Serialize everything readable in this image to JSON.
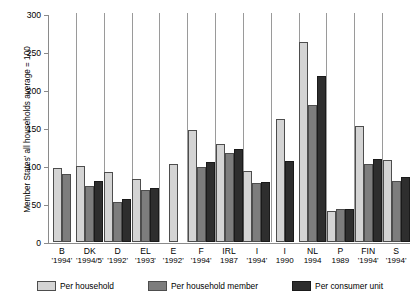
{
  "chart_data": {
    "type": "bar",
    "title": "",
    "subtitle": "",
    "xlabel": "",
    "ylabel": "Member States' all households average = 100",
    "ylim": [
      0,
      300
    ],
    "yticks": [
      0,
      50,
      100,
      150,
      200,
      250,
      300
    ],
    "grid": false,
    "legend_position": "bottom",
    "categories": [
      "B",
      "DK",
      "D",
      "EL",
      "E",
      "F",
      "IRL",
      "I",
      "I",
      "NL",
      "P",
      "FIN",
      "S"
    ],
    "category_years": [
      "'1994'",
      "'1994/5'",
      "'1992'",
      "'1993'",
      "'1992'",
      "'1994'",
      "1987",
      "'1994'",
      "1990",
      "1994",
      "1989",
      "'1994'",
      "'1994'"
    ],
    "series": [
      {
        "name": "Per household",
        "color": "#d4d4d4",
        "values": [
          97,
          100,
          92,
          83,
          103,
          148,
          129,
          94,
          162,
          263,
          41,
          152,
          108
        ]
      },
      {
        "name": "Per household member",
        "color": "#7d7d7d",
        "values": [
          90,
          74,
          53,
          68,
          null,
          99,
          117,
          77,
          null,
          180,
          44,
          102,
          80
        ]
      },
      {
        "name": "Per consumer unit",
        "color": "#2e2e2e",
        "values": [
          null,
          80,
          56,
          71,
          null,
          105,
          122,
          79,
          107,
          218,
          44,
          109,
          85
        ]
      }
    ]
  }
}
